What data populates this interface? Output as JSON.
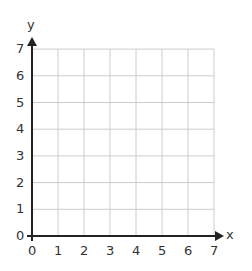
{
  "chart_data": {
    "type": "scatter",
    "title": "",
    "xlabel": "x",
    "ylabel": "y",
    "xlim": [
      0,
      7
    ],
    "ylim": [
      0,
      7
    ],
    "grid": true,
    "x_ticks": [
      "0",
      "1",
      "2",
      "3",
      "4",
      "5",
      "6",
      "7"
    ],
    "y_ticks": [
      "0",
      "1",
      "2",
      "3",
      "4",
      "5",
      "6",
      "7"
    ],
    "series": []
  },
  "axes": {
    "x_label": "x",
    "y_label": "y"
  },
  "colors": {
    "grid": "#cccccc",
    "axis": "#222222",
    "text": "#333333"
  }
}
